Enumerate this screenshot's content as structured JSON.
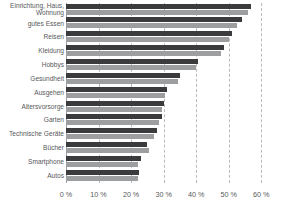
{
  "chart_data": {
    "type": "bar",
    "orientation": "horizontal",
    "title": "",
    "subtitle": "",
    "xlabel": "",
    "ylabel": "",
    "xlim": [
      0,
      63
    ],
    "xticks": [
      0,
      10,
      20,
      30,
      40,
      50,
      60
    ],
    "xtick_labels": [
      "0 %",
      "10 %",
      "20 %",
      "30 %",
      "40 %",
      "50 %",
      "60 %"
    ],
    "grid": true,
    "grid_axis": "x",
    "legend": "none",
    "categories": [
      "Einrichtung, Haus,\nWohnung",
      "gutes Essen",
      "Reisen",
      "Kleidung",
      "Hobbys",
      "Gesundheit",
      "Ausgehen",
      "Altersvorsorge",
      "Garten",
      "Technische Geräte",
      "Bücher",
      "Smartphone",
      "Autos"
    ],
    "series": [
      {
        "name": "series-1",
        "color": "#3b3b3d",
        "values": [
          57.0,
          54.0,
          51.0,
          48.5,
          40.5,
          35.0,
          31.0,
          30.0,
          29.5,
          28.0,
          25.0,
          23.0,
          22.5
        ]
      },
      {
        "name": "series-2",
        "color": "#9d9ea0",
        "values": [
          56.0,
          52.5,
          50.0,
          47.5,
          40.0,
          34.5,
          30.5,
          29.5,
          28.5,
          27.0,
          25.5,
          22.0,
          22.0
        ]
      }
    ]
  }
}
